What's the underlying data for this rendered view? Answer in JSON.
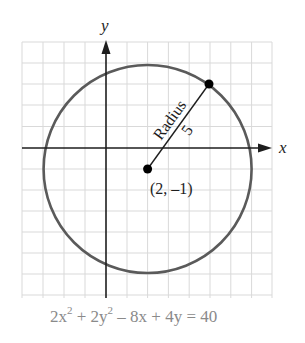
{
  "diagram": {
    "type": "circle-on-coordinate-grid",
    "axes": {
      "x_label": "x",
      "y_label": "y"
    },
    "grid": {
      "x_range": [
        -4,
        8
      ],
      "y_range": [
        -7,
        5
      ],
      "cell_px": 20.8
    },
    "circle": {
      "center": {
        "x": 2,
        "y": -1
      },
      "radius": 5,
      "stroke_color": "#5a5a5a"
    },
    "center_label": "(2, –1)",
    "radius_point": {
      "x": 5,
      "y": 3
    },
    "radius_label": "Radius",
    "radius_value": "5",
    "equation": {
      "term1": "2x",
      "exp1": "2",
      "term2": " + 2y",
      "exp2": "2",
      "rest": " – 8x + 4y = 40",
      "color": "#8a8a8a"
    },
    "colors": {
      "grid": "#d9d9d9",
      "axis": "#1e1e1e",
      "point": "#000000"
    }
  }
}
